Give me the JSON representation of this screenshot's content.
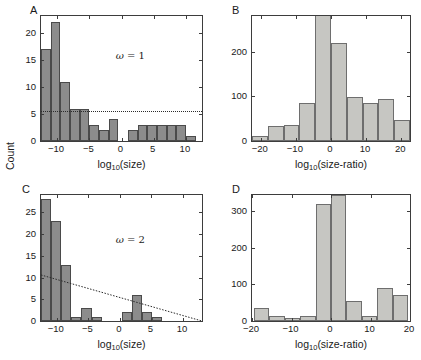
{
  "figure": {
    "ylabel": "Count",
    "panels": [
      {
        "letter": "A",
        "annotation_symbol": "ω",
        "annotation_text": " = 1",
        "xlabel_main": "log",
        "xlabel_sub": "10",
        "xlabel_tail": "(size)",
        "xticks": [
          "-10",
          "-5",
          "0",
          "5",
          "10"
        ],
        "yticks": [
          "0",
          "5",
          "10",
          "15",
          "20"
        ]
      },
      {
        "letter": "B",
        "xlabel_main": "log",
        "xlabel_sub": "10",
        "xlabel_tail": "(size-ratio)",
        "xticks": [
          "-20",
          "-10",
          "0",
          "10",
          "20"
        ],
        "yticks": [
          "0",
          "100",
          "200"
        ]
      },
      {
        "letter": "C",
        "annotation_symbol": "ω",
        "annotation_text": " = 2",
        "xlabel_main": "log",
        "xlabel_sub": "10",
        "xlabel_tail": "(size)",
        "xticks": [
          "-10",
          "-5",
          "0",
          "5",
          "10"
        ],
        "yticks": [
          "0",
          "5",
          "10",
          "15",
          "20",
          "25"
        ]
      },
      {
        "letter": "D",
        "xlabel_main": "log",
        "xlabel_sub": "10",
        "xlabel_tail": "(size-ratio)",
        "xticks": [
          "-20",
          "-10",
          "0",
          "10",
          "20"
        ],
        "yticks": [
          "0",
          "100",
          "200",
          "300"
        ]
      }
    ]
  },
  "chart_data": [
    {
      "type": "bar",
      "panel": "A",
      "title": "",
      "xlabel": "log10(size)",
      "ylabel": "Count",
      "xlim": [
        -12.5,
        12.5
      ],
      "ylim": [
        0,
        23.2
      ],
      "grid": false,
      "legend": null,
      "annotation": "ω = 1",
      "bin_width": 1.5,
      "bin_edges": [
        -12.5,
        -11,
        -9.5,
        -8,
        -6.5,
        -5,
        -3.5,
        -2,
        -0.5,
        1,
        2.5,
        4,
        5.5,
        7,
        8.5,
        10,
        11.5
      ],
      "bin_centers": [
        -11.75,
        -10.25,
        -8.75,
        -7.25,
        -5.75,
        -4.25,
        -2.75,
        -1.25,
        0.25,
        1.75,
        3.25,
        4.75,
        6.25,
        7.75,
        9.25,
        10.75
      ],
      "values": [
        17,
        22,
        11,
        6,
        6,
        3,
        2,
        4,
        0,
        2,
        3,
        3,
        3,
        3,
        3,
        1
      ],
      "reference_line": {
        "type": "horizontal-dotted",
        "y": 5.3
      },
      "xticks": [
        -10,
        -5,
        0,
        5,
        10
      ],
      "yticks": [
        0,
        5,
        10,
        15,
        20
      ]
    },
    {
      "type": "bar",
      "panel": "B",
      "title": "",
      "xlabel": "log10(size-ratio)",
      "ylabel": "Count",
      "xlim": [
        -22.5,
        22.5
      ],
      "ylim": [
        0,
        280
      ],
      "grid": false,
      "legend": null,
      "bin_width": 4.5,
      "bin_edges": [
        -22.5,
        -18,
        -13.5,
        -9,
        -4.5,
        0,
        4.5,
        9,
        13.5,
        18,
        22.5
      ],
      "bin_centers": [
        -20.25,
        -15.75,
        -11.25,
        -6.75,
        -2.25,
        2.25,
        6.75,
        11.25,
        15.75,
        20.25
      ],
      "values": [
        12,
        34,
        35,
        85,
        282,
        220,
        98,
        85,
        95,
        46
      ],
      "xticks": [
        -20,
        -10,
        0,
        10,
        20
      ],
      "yticks": [
        0,
        100,
        200
      ]
    },
    {
      "type": "bar",
      "panel": "C",
      "title": "",
      "xlabel": "log10(size)",
      "ylabel": "Count",
      "xlim": [
        -12.5,
        13
      ],
      "ylim": [
        0,
        29
      ],
      "grid": false,
      "legend": null,
      "annotation": "ω = 2",
      "bin_width": 1.6,
      "bin_edges": [
        -12.5,
        -10.9,
        -9.3,
        -7.7,
        -6.1,
        -4.5,
        -2.9,
        -1.3,
        0.3,
        1.9,
        3.5,
        5.1,
        6.7
      ],
      "bin_centers": [
        -11.7,
        -10.1,
        -8.5,
        -6.9,
        -5.3,
        -3.7,
        -2.1,
        -0.5,
        1.1,
        2.7,
        4.3,
        5.9
      ],
      "values": [
        28,
        23,
        13,
        1,
        3,
        1,
        0,
        0,
        2,
        6,
        2,
        1
      ],
      "reference_line": {
        "type": "linear-dotted",
        "x0": -12.5,
        "y0": 10.6,
        "x1": 13,
        "y1": 0
      },
      "xticks": [
        -10,
        -5,
        0,
        5,
        10
      ],
      "yticks": [
        0,
        5,
        10,
        15,
        20,
        25
      ]
    },
    {
      "type": "bar",
      "panel": "D",
      "title": "",
      "xlabel": "log10(size-ratio)",
      "ylabel": "Count",
      "xlim": [
        -20,
        20
      ],
      "ylim": [
        0,
        345
      ],
      "grid": false,
      "legend": null,
      "bin_width": 3.9,
      "bin_edges": [
        -19.5,
        -15.6,
        -11.7,
        -7.8,
        -3.9,
        0,
        3.9,
        7.8,
        11.7,
        15.6,
        19.5
      ],
      "bin_centers": [
        -17.55,
        -13.65,
        -9.75,
        -5.85,
        -1.95,
        1.95,
        5.85,
        9.75,
        13.65,
        17.55
      ],
      "values": [
        37,
        15,
        7,
        15,
        320,
        345,
        55,
        15,
        90,
        70
      ],
      "xticks": [
        -20,
        -10,
        0,
        10,
        20
      ],
      "yticks": [
        0,
        100,
        200,
        300
      ]
    }
  ]
}
